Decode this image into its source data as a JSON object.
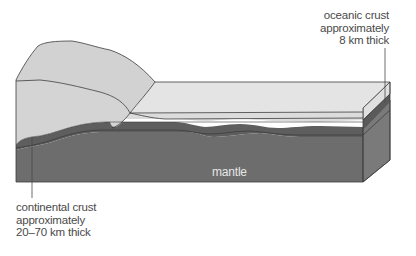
{
  "diagram": {
    "labels": {
      "oceanic": {
        "line1": "oceanic crust",
        "line2": "approximately",
        "line3": "8 km thick"
      },
      "continental": {
        "line1": "continental crust",
        "line2": "approximately",
        "line3": "20–70 km thick"
      },
      "mantle": "mantle"
    },
    "colors": {
      "continental_crust": "#d2d2d2",
      "oceanic_crust_top": "#e4e4e4",
      "oceanic_crust_front": "#dcdcdc",
      "lithosphere_band": "#5e5e5e",
      "mantle_front": "#6d6d6d",
      "mantle_side": "#7a7a7a",
      "outline": "#3c3c3c",
      "label_text": "#4a4a4a",
      "mantle_text": "#e6e6e6"
    }
  }
}
